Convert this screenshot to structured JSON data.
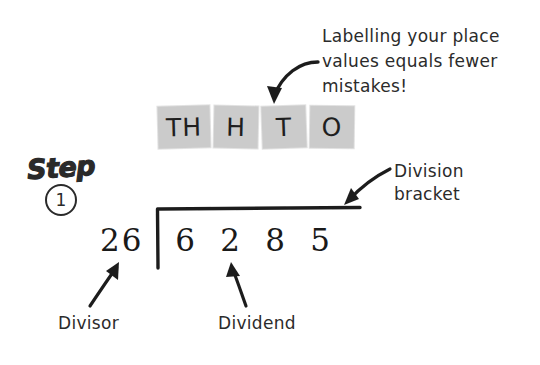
{
  "page": {
    "background_color": "#ffffff",
    "ink_color": "#1a1a1a",
    "highlight_color": "#cbcbcb"
  },
  "note": {
    "text": "Labelling your place\nvalues equals fewer\nmistakes!"
  },
  "step_badge": {
    "word": "Step",
    "number": "1"
  },
  "place_values": {
    "items": [
      {
        "label": "TH",
        "meaning": "thousands"
      },
      {
        "label": "H",
        "meaning": "hundreds"
      },
      {
        "label": "T",
        "meaning": "tens"
      },
      {
        "label": "O",
        "meaning": "ones"
      }
    ]
  },
  "division": {
    "divisor": "26",
    "dividend_digits": [
      "6",
      "2",
      "8",
      "5"
    ],
    "dividend": "6285"
  },
  "callouts": {
    "division_bracket": "Division\nbracket",
    "divisor": "Divisor",
    "dividend": "Dividend"
  }
}
